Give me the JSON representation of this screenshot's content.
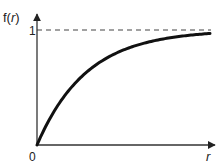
{
  "chart_data": {
    "type": "line",
    "title": "",
    "xlabel": "r",
    "ylabel": "f(r)",
    "x_tick_labels": [
      "0"
    ],
    "y_tick_labels": [
      "1"
    ],
    "asymptote": {
      "y": 1,
      "style": "dashed"
    },
    "xlim": [
      0,
      3.5
    ],
    "ylim": [
      0,
      1
    ],
    "grid": false,
    "legend": null,
    "series": [
      {
        "name": "f(r) = 1 - e^(-r)",
        "x": [
          0,
          0.25,
          0.5,
          0.75,
          1.0,
          1.25,
          1.5,
          2.0,
          2.5,
          3.0,
          3.5
        ],
        "values": [
          0,
          0.22,
          0.39,
          0.53,
          0.63,
          0.71,
          0.78,
          0.86,
          0.92,
          0.95,
          0.97
        ]
      }
    ]
  },
  "labels": {
    "y_axis": "f(r)",
    "y_axis_f": "f(",
    "y_axis_r": "r",
    "y_axis_close": ")",
    "x_axis": "r",
    "origin": "0",
    "one": "1"
  },
  "colors": {
    "curve": "#111111",
    "axis": "#333333",
    "dash": "#444444"
  }
}
